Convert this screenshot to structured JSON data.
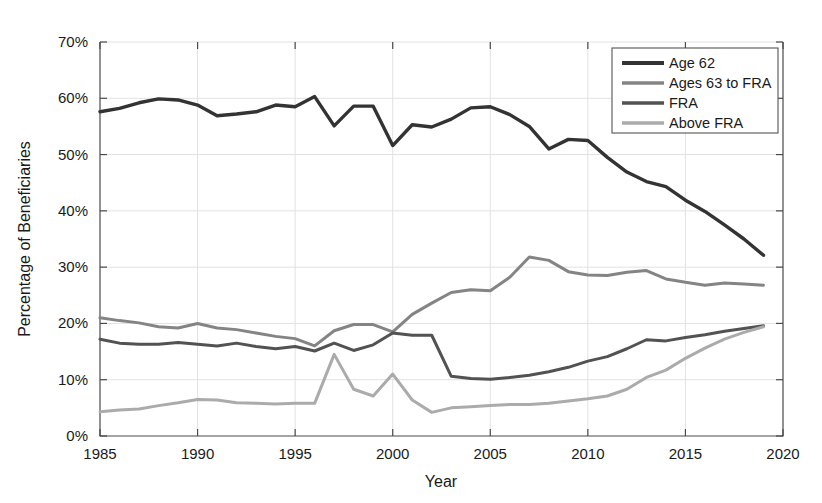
{
  "chart_data": {
    "type": "line",
    "title": "",
    "xlabel": "Year",
    "ylabel": "Percentage of Beneficiaries",
    "xlim": [
      1985,
      2020
    ],
    "ylim": [
      0,
      70
    ],
    "xticks": [
      1985,
      1990,
      1995,
      2000,
      2005,
      2010,
      2015,
      2020
    ],
    "xtick_labels": [
      "1985",
      "1990",
      "1995",
      "2000",
      "2005",
      "2010",
      "2015",
      "2020"
    ],
    "yticks": [
      0,
      10,
      20,
      30,
      40,
      50,
      60,
      70
    ],
    "ytick_labels": [
      "0%",
      "10%",
      "20%",
      "30%",
      "40%",
      "50%",
      "60%",
      "70%"
    ],
    "grid": true,
    "legend_position": "top-right",
    "x": [
      1985,
      1986,
      1987,
      1988,
      1989,
      1990,
      1991,
      1992,
      1993,
      1994,
      1995,
      1996,
      1997,
      1998,
      1999,
      2000,
      2001,
      2002,
      2003,
      2004,
      2005,
      2006,
      2007,
      2008,
      2009,
      2010,
      2011,
      2012,
      2013,
      2014,
      2015,
      2016,
      2017,
      2018,
      2019
    ],
    "series": [
      {
        "name": "Age 62",
        "color": "#333333",
        "values": [
          57.6,
          58.2,
          59.2,
          59.9,
          59.7,
          58.8,
          56.9,
          57.2,
          57.6,
          58.8,
          58.5,
          60.3,
          55.1,
          58.6,
          58.6,
          51.6,
          55.3,
          54.9,
          56.3,
          58.3,
          58.5,
          57.1,
          55.0,
          51.0,
          52.7,
          52.5,
          49.5,
          46.9,
          45.2,
          44.3,
          41.9,
          39.9,
          37.5,
          35.0,
          32.1
        ]
      },
      {
        "name": "Ages 63 to FRA",
        "color": "#848484",
        "values": [
          21.0,
          20.5,
          20.1,
          19.4,
          19.2,
          20.0,
          19.2,
          18.9,
          18.3,
          17.7,
          17.3,
          16.0,
          18.7,
          19.8,
          19.8,
          18.5,
          21.6,
          23.6,
          25.5,
          26.0,
          25.8,
          28.2,
          31.8,
          31.2,
          29.2,
          28.6,
          28.5,
          29.1,
          29.4,
          27.9,
          27.3,
          26.8,
          27.2,
          27.0,
          26.8
        ]
      },
      {
        "name": "FRA",
        "color": "#525252",
        "values": [
          17.2,
          16.5,
          16.3,
          16.3,
          16.6,
          16.3,
          16.0,
          16.5,
          15.9,
          15.5,
          15.9,
          15.1,
          16.5,
          15.2,
          16.2,
          18.3,
          17.9,
          17.9,
          10.6,
          10.2,
          10.1,
          10.4,
          10.8,
          11.4,
          12.2,
          13.3,
          14.1,
          15.5,
          17.1,
          16.9,
          17.5,
          18.0,
          18.6,
          19.1,
          19.6
        ]
      },
      {
        "name": "Above FRA",
        "color": "#ababab",
        "values": [
          4.3,
          4.6,
          4.8,
          5.4,
          5.9,
          6.5,
          6.4,
          5.9,
          5.8,
          5.7,
          5.8,
          5.8,
          14.5,
          8.3,
          7.1,
          11.0,
          6.4,
          4.2,
          5.0,
          5.2,
          5.4,
          5.6,
          5.6,
          5.8,
          6.2,
          6.6,
          7.1,
          8.3,
          10.4,
          11.7,
          13.8,
          15.6,
          17.2,
          18.4,
          19.4
        ]
      }
    ]
  },
  "legend": {
    "items": [
      {
        "label": "Age 62"
      },
      {
        "label": "Ages 63 to FRA"
      },
      {
        "label": "FRA"
      },
      {
        "label": "Above FRA"
      }
    ]
  }
}
